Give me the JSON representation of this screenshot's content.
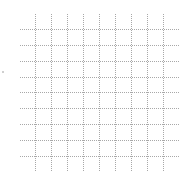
{
  "chart_data": {
    "type": "scatter",
    "title": "",
    "xlabel": "",
    "ylabel": "",
    "series": [],
    "grid": true,
    "grid_style": "dotted",
    "grid_color": "#a8a8a8",
    "vertical_gridlines_x": [
      35,
      51,
      67,
      83,
      99,
      115,
      131,
      147,
      163
    ],
    "horizontal_gridlines_y": [
      29,
      45,
      61,
      77,
      92,
      108,
      124,
      140,
      156
    ],
    "vertical_extent": [
      14,
      172
    ],
    "horizontal_extent": [
      20,
      180
    ],
    "legend": null
  }
}
